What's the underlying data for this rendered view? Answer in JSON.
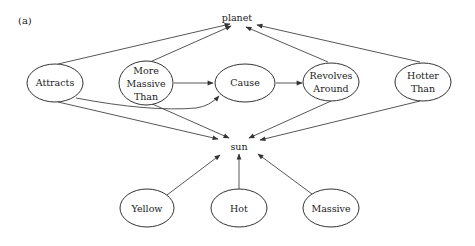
{
  "figure": {
    "panel_label": "(a)",
    "nodes": {
      "planet": {
        "label": "planet",
        "x": 237,
        "y": 18
      },
      "sun": {
        "label": "sun",
        "x": 239,
        "y": 147
      },
      "attracts": {
        "lines": [
          "Attracts"
        ],
        "x": 55,
        "y": 83,
        "rx": 28,
        "ry": 19
      },
      "more_massive_than": {
        "lines": [
          "More",
          "Massive",
          "Than"
        ],
        "x": 146,
        "y": 83,
        "rx": 27,
        "ry": 22
      },
      "cause": {
        "lines": [
          "Cause"
        ],
        "x": 245,
        "y": 83,
        "rx": 30,
        "ry": 19
      },
      "revolves_around": {
        "lines": [
          "Revolves",
          "Around"
        ],
        "x": 331,
        "y": 82,
        "rx": 28,
        "ry": 19
      },
      "hotter_than": {
        "lines": [
          "Hotter",
          "Than"
        ],
        "x": 423,
        "y": 82,
        "rx": 28,
        "ry": 19
      },
      "yellow": {
        "lines": [
          "Yellow"
        ],
        "x": 147,
        "y": 208,
        "rx": 27,
        "ry": 19
      },
      "hot": {
        "lines": [
          "Hot"
        ],
        "x": 239,
        "y": 208,
        "rx": 28,
        "ry": 19
      },
      "massive": {
        "lines": [
          "Massive"
        ],
        "x": 331,
        "y": 208,
        "rx": 28,
        "ry": 19
      }
    },
    "edges": [
      {
        "from": "attracts",
        "to": "planet"
      },
      {
        "from": "more_massive_than",
        "to": "planet"
      },
      {
        "from": "revolves_around",
        "to": "planet"
      },
      {
        "from": "hotter_than",
        "to": "planet"
      },
      {
        "from": "more_massive_than",
        "to": "cause"
      },
      {
        "from": "attracts",
        "to": "cause"
      },
      {
        "from": "cause",
        "to": "revolves_around"
      },
      {
        "from": "attracts",
        "to": "sun"
      },
      {
        "from": "more_massive_than",
        "to": "sun"
      },
      {
        "from": "revolves_around",
        "to": "sun"
      },
      {
        "from": "hotter_than",
        "to": "sun"
      },
      {
        "from": "yellow",
        "to": "sun"
      },
      {
        "from": "hot",
        "to": "sun"
      },
      {
        "from": "massive",
        "to": "sun"
      }
    ]
  }
}
